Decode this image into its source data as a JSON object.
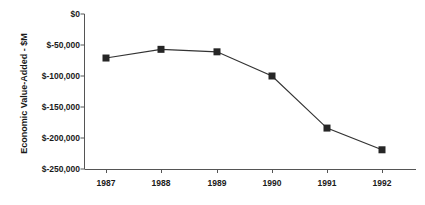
{
  "chart_data": {
    "type": "line",
    "title": "",
    "xlabel": "",
    "ylabel": "Economic Value-Added - $M",
    "categories": [
      "1987",
      "1988",
      "1989",
      "1990",
      "1991",
      "1992"
    ],
    "values": [
      -71000,
      -57000,
      -61000,
      -100000,
      -184000,
      -219000
    ],
    "series": [
      {
        "name": "Economic Value-Added",
        "values": [
          -71000,
          -57000,
          -61000,
          -100000,
          -184000,
          -219000
        ]
      }
    ],
    "ylim": [
      -250000,
      0
    ],
    "ytick_values": [
      0,
      -50000,
      -100000,
      -150000,
      -200000,
      -250000
    ],
    "ytick_labels": [
      "$0",
      "$-50,000",
      "$-100,000",
      "$-150,000",
      "$-200,000",
      "$-250,000"
    ],
    "xtick_labels": [
      "1987",
      "1988",
      "1989",
      "1990",
      "1991",
      "1992"
    ],
    "grid": false,
    "legend": false,
    "legend_position": "none",
    "marker": "square",
    "colors": {
      "line": "#333333",
      "marker": "#262626",
      "axis": "#555555",
      "text": "#1a1a1a",
      "background": "#ffffff"
    }
  }
}
